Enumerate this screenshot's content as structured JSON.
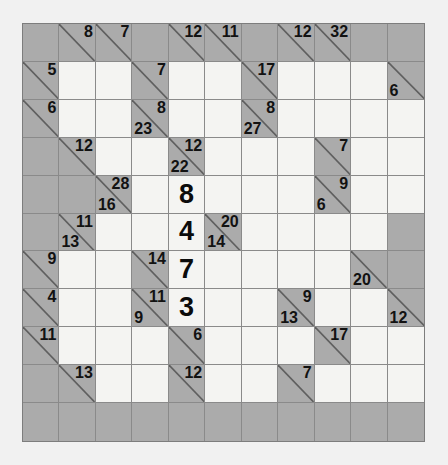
{
  "puzzle": {
    "name": "kakuro-grid",
    "rows": 11,
    "cols": 11,
    "colors": {
      "page_background": "#f1f1f1",
      "block_fill": "#ababab",
      "open_fill": "#f4f4f2",
      "grid_line": "#8a8a8a",
      "border": "#7d7d7d",
      "clue_text": "#121212",
      "answer_text": "#0b0b0b"
    },
    "cells": [
      [
        {
          "t": "block"
        },
        {
          "t": "clue",
          "across": "8"
        },
        {
          "t": "clue",
          "across": "7"
        },
        {
          "t": "block"
        },
        {
          "t": "clue",
          "across": "12"
        },
        {
          "t": "clue",
          "across": "11"
        },
        {
          "t": "block"
        },
        {
          "t": "clue",
          "across": "12"
        },
        {
          "t": "clue",
          "across": "32"
        },
        {
          "t": "block"
        },
        {
          "t": "block"
        }
      ],
      [
        {
          "t": "clue",
          "across": "5"
        },
        {
          "t": "open"
        },
        {
          "t": "open"
        },
        {
          "t": "clue",
          "across": "7"
        },
        {
          "t": "open"
        },
        {
          "t": "open"
        },
        {
          "t": "clue",
          "across": "17"
        },
        {
          "t": "open"
        },
        {
          "t": "open"
        },
        {
          "t": "open"
        },
        {
          "t": "clue",
          "down": "6"
        }
      ],
      [
        {
          "t": "clue",
          "across": "6"
        },
        {
          "t": "open"
        },
        {
          "t": "open"
        },
        {
          "t": "clue",
          "across": "8",
          "down": "23"
        },
        {
          "t": "open"
        },
        {
          "t": "open"
        },
        {
          "t": "clue",
          "across": "8",
          "down": "27"
        },
        {
          "t": "open"
        },
        {
          "t": "open"
        },
        {
          "t": "open"
        },
        {
          "t": "open"
        }
      ],
      [
        {
          "t": "block"
        },
        {
          "t": "clue",
          "across": "12"
        },
        {
          "t": "open"
        },
        {
          "t": "open"
        },
        {
          "t": "clue",
          "across": "12",
          "down": "22"
        },
        {
          "t": "open"
        },
        {
          "t": "open"
        },
        {
          "t": "open"
        },
        {
          "t": "clue",
          "across": "7"
        },
        {
          "t": "open"
        },
        {
          "t": "open"
        }
      ],
      [
        {
          "t": "block"
        },
        {
          "t": "block"
        },
        {
          "t": "clue",
          "across": "28",
          "down": "16"
        },
        {
          "t": "open"
        },
        {
          "t": "answer",
          "value": "8"
        },
        {
          "t": "open"
        },
        {
          "t": "open"
        },
        {
          "t": "open"
        },
        {
          "t": "clue",
          "across": "9",
          "down": "6"
        },
        {
          "t": "open"
        },
        {
          "t": "open"
        }
      ],
      [
        {
          "t": "block"
        },
        {
          "t": "clue",
          "across": "11",
          "down": "13"
        },
        {
          "t": "open"
        },
        {
          "t": "open"
        },
        {
          "t": "answer",
          "value": "4"
        },
        {
          "t": "clue",
          "across": "20",
          "down": "14"
        },
        {
          "t": "open"
        },
        {
          "t": "open"
        },
        {
          "t": "open"
        },
        {
          "t": "open"
        },
        {
          "t": "block"
        }
      ],
      [
        {
          "t": "clue",
          "across": "9"
        },
        {
          "t": "open"
        },
        {
          "t": "open"
        },
        {
          "t": "clue",
          "across": "14"
        },
        {
          "t": "answer",
          "value": "7"
        },
        {
          "t": "open"
        },
        {
          "t": "open"
        },
        {
          "t": "open"
        },
        {
          "t": "open"
        },
        {
          "t": "clue",
          "down": "20"
        },
        {
          "t": "block"
        }
      ],
      [
        {
          "t": "clue",
          "across": "4"
        },
        {
          "t": "open"
        },
        {
          "t": "open"
        },
        {
          "t": "clue",
          "across": "11",
          "down": "9"
        },
        {
          "t": "answer",
          "value": "3"
        },
        {
          "t": "open"
        },
        {
          "t": "open"
        },
        {
          "t": "clue",
          "across": "9",
          "down": "13"
        },
        {
          "t": "open"
        },
        {
          "t": "open"
        },
        {
          "t": "clue",
          "down": "12"
        }
      ],
      [
        {
          "t": "clue",
          "across": "11"
        },
        {
          "t": "open"
        },
        {
          "t": "open"
        },
        {
          "t": "open"
        },
        {
          "t": "clue",
          "across": "6"
        },
        {
          "t": "open"
        },
        {
          "t": "open"
        },
        {
          "t": "open"
        },
        {
          "t": "clue",
          "across": "17"
        },
        {
          "t": "open"
        },
        {
          "t": "open"
        }
      ],
      [
        {
          "t": "block"
        },
        {
          "t": "clue",
          "across": "13"
        },
        {
          "t": "open"
        },
        {
          "t": "open"
        },
        {
          "t": "clue",
          "across": "12"
        },
        {
          "t": "open"
        },
        {
          "t": "open"
        },
        {
          "t": "clue",
          "across": "7"
        },
        {
          "t": "open"
        },
        {
          "t": "open"
        },
        {
          "t": "open"
        }
      ],
      [
        {
          "t": "block"
        },
        {
          "t": "block"
        },
        {
          "t": "block"
        },
        {
          "t": "block"
        },
        {
          "t": "block"
        },
        {
          "t": "block"
        },
        {
          "t": "block"
        },
        {
          "t": "block"
        },
        {
          "t": "block"
        },
        {
          "t": "block"
        },
        {
          "t": "block"
        }
      ]
    ]
  }
}
